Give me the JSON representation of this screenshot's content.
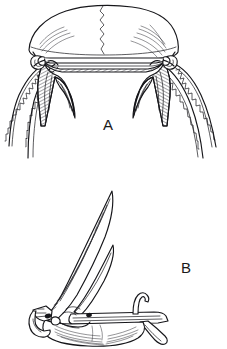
{
  "plate": {
    "title": "Anatomical line illustration plate",
    "background_color": "#ffffff",
    "ink_color": "#16161a",
    "width": 227,
    "height": 349,
    "medium": "pen-and-ink line engraving with hatching"
  },
  "figures": [
    {
      "id": "A",
      "label": "A",
      "label_x": 108,
      "label_y": 130,
      "caption": "A",
      "view": "dorsal view of skull and pectoral girdle with paired serrated spines",
      "description": "Broad rounded cranial shield with median zigzag suture, arched ventral margin, paired hatched descending processes terminating in downward points, and two long serrated spines extending laterally from each side.",
      "parts": [
        "cranial shield",
        "median suture",
        "left descending process",
        "right descending process",
        "left serrated spine pair",
        "right serrated spine pair"
      ],
      "serrated_spine_count": 4,
      "symmetry": "bilateral"
    },
    {
      "id": "B",
      "label": "B",
      "label_x": 186,
      "label_y": 273,
      "caption": "B",
      "view": "lateral view of pectoral girdle with erect spines",
      "description": "Elongate horizontal girdle element with two long tapering curved spines rising from the anterior end, a short recurved hook at mid-length, a posterior tapering process directed downward, and fine radiating hatch lines on the body.",
      "parts": [
        "long anterior spine",
        "secondary spine",
        "median recurved hook",
        "horizontal girdle bar",
        "posterior process",
        "anterior flange"
      ],
      "spine_count": 2,
      "symmetry": "none"
    }
  ],
  "labels": {
    "figure_a": "A",
    "figure_b": "B"
  },
  "icons": {
    "figure_a_drawing": "skull-dorsal-drawing",
    "figure_b_drawing": "girdle-lateral-drawing"
  }
}
